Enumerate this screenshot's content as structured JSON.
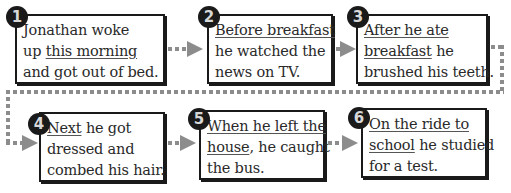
{
  "steps": [
    {
      "number": "1",
      "lines": [
        [
          {
            "text": "Jonathan woke",
            "u": false
          }
        ],
        [
          {
            "text": "up ",
            "u": false
          },
          {
            "text": "this morning",
            "u": true
          }
        ],
        [
          {
            "text": "and got out of bed.",
            "u": false
          }
        ]
      ]
    },
    {
      "number": "2",
      "lines": [
        [
          {
            "text": "Before breakfast",
            "u": true
          }
        ],
        [
          {
            "text": "he watched the",
            "u": false
          }
        ],
        [
          {
            "text": "news on TV.",
            "u": false
          }
        ]
      ]
    },
    {
      "number": "3",
      "lines": [
        [
          {
            "text": "After he ate",
            "u": true
          }
        ],
        [
          {
            "text": "breakfast",
            "u": true
          },
          {
            "text": " he",
            "u": false
          }
        ],
        [
          {
            "text": "brushed his teeth.",
            "u": false
          }
        ]
      ]
    },
    {
      "number": "4",
      "lines": [
        [
          {
            "text": "Next",
            "u": true
          },
          {
            "text": " he got",
            "u": false
          }
        ],
        [
          {
            "text": "dressed and",
            "u": false
          }
        ],
        [
          {
            "text": "combed his hair.",
            "u": false
          }
        ]
      ]
    },
    {
      "number": "5",
      "lines": [
        [
          {
            "text": "When he left the",
            "u": true
          }
        ],
        [
          {
            "text": "house",
            "u": true
          },
          {
            "text": ", he caught",
            "u": false
          }
        ],
        [
          {
            "text": "the bus.",
            "u": false
          }
        ]
      ]
    },
    {
      "number": "6",
      "lines": [
        [
          {
            "text": "On the ride to",
            "u": true
          }
        ],
        [
          {
            "text": "school",
            "u": true
          },
          {
            "text": " he studied",
            "u": false
          }
        ],
        [
          {
            "text": "for a test.",
            "u": false
          }
        ]
      ]
    }
  ],
  "colors": {
    "border": "#1a1a1a",
    "connector": "#8c8c8c",
    "text": "#2a2a2a"
  }
}
